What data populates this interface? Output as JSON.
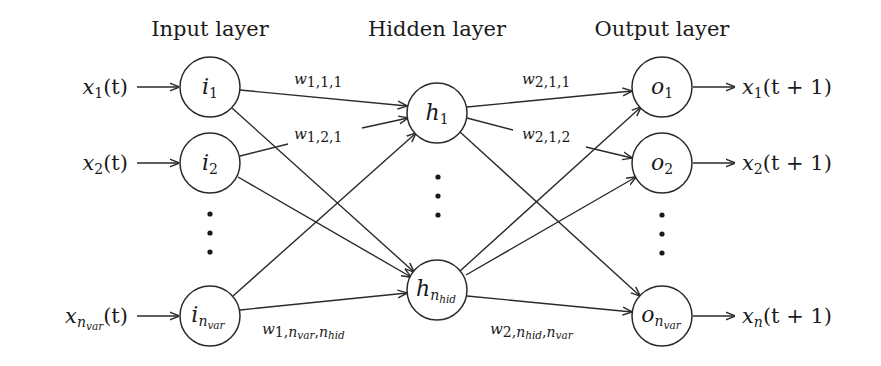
{
  "diagram": {
    "type": "feedforward-neural-network",
    "layers": [
      {
        "id": "input",
        "title": "Input layer"
      },
      {
        "id": "hidden",
        "title": "Hidden layer"
      },
      {
        "id": "output",
        "title": "Output layer"
      }
    ],
    "input_nodes": [
      {
        "id": "i1",
        "base": "i",
        "sub": "1",
        "input_label": {
          "base": "x",
          "sub": "1",
          "suffix": "(t)"
        }
      },
      {
        "id": "i2",
        "base": "i",
        "sub": "2",
        "input_label": {
          "base": "x",
          "sub": "2",
          "suffix": "(t)"
        }
      },
      {
        "id": "i_nvar",
        "base": "i",
        "sub": "n",
        "subsub": "var",
        "input_label": {
          "base": "x",
          "sub": "n",
          "subsub": "var",
          "suffix": "(t)"
        }
      }
    ],
    "hidden_nodes": [
      {
        "id": "h1",
        "base": "h",
        "sub": "1"
      },
      {
        "id": "h_nhid",
        "base": "h",
        "sub": "n",
        "subsub": "hid"
      }
    ],
    "output_nodes": [
      {
        "id": "o1",
        "base": "o",
        "sub": "1",
        "output_label": {
          "base": "x",
          "sub": "1",
          "suffix": "(t + 1)"
        }
      },
      {
        "id": "o2",
        "base": "o",
        "sub": "2",
        "output_label": {
          "base": "x",
          "sub": "2",
          "suffix": "(t + 1)"
        }
      },
      {
        "id": "o_nvar",
        "base": "o",
        "sub": "n",
        "subsub": "var",
        "output_label": {
          "base": "x",
          "sub": "n",
          "suffix": "(t + 1)"
        }
      }
    ],
    "weight_labels": {
      "w111": {
        "base": "w",
        "sub": "1,1,1"
      },
      "w121": {
        "base": "w",
        "sub": "1,2,1"
      },
      "w1_last": {
        "base": "w",
        "sub_prefix": "1,",
        "n1": "n",
        "n1_sub": "var",
        "sep": ",",
        "n2": "n",
        "n2_sub": "hid"
      },
      "w211": {
        "base": "w",
        "sub": "2,1,1"
      },
      "w212": {
        "base": "w",
        "sub": "2,1,2"
      },
      "w2_last": {
        "base": "w",
        "sub_prefix": "2,",
        "n1": "n",
        "n1_sub": "hid",
        "sep": ",",
        "n2": "n",
        "n2_sub": "var"
      }
    },
    "ellipsis": "⋮",
    "edges": [
      [
        "i1",
        "h1"
      ],
      [
        "i1",
        "h_nhid"
      ],
      [
        "i2",
        "h1"
      ],
      [
        "i2",
        "h_nhid"
      ],
      [
        "i_nvar",
        "h1"
      ],
      [
        "i_nvar",
        "h_nhid"
      ],
      [
        "h1",
        "o1"
      ],
      [
        "h1",
        "o2"
      ],
      [
        "h1",
        "o_nvar"
      ],
      [
        "h_nhid",
        "o1"
      ],
      [
        "h_nhid",
        "o2"
      ],
      [
        "h_nhid",
        "o_nvar"
      ]
    ]
  }
}
